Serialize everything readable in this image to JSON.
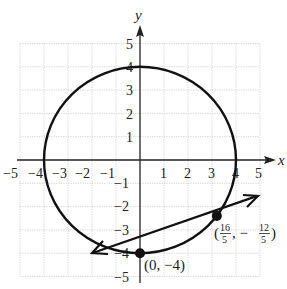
{
  "diagram": {
    "type": "coordinate-plane",
    "axes": {
      "x_label": "x",
      "y_label": "y",
      "x_range": [
        -5,
        5
      ],
      "y_range": [
        -5,
        5
      ],
      "x_ticks": [
        "−5",
        "−4",
        "−3",
        "−2",
        "−1",
        "1",
        "2",
        "3",
        "4",
        "5"
      ],
      "y_ticks": [
        "5",
        "4",
        "3",
        "2",
        "1",
        "−1",
        "−2",
        "−3",
        "−4",
        "−5"
      ],
      "grid": true
    },
    "circle": {
      "equation": "x^2 + y^2 = 16",
      "center": [
        0,
        0
      ],
      "radius": 4
    },
    "line": {
      "equation": "y = x/2 - 4",
      "slope": 0.5,
      "intercept": -4,
      "x_from": -2,
      "x_to": 5,
      "arrows": "both"
    },
    "points": [
      {
        "x": 0,
        "y": -4,
        "label": "(0, −4)"
      },
      {
        "x": 3.2,
        "y": -2.4,
        "label_open": "(",
        "num1": "16",
        "den1": "5",
        "sep": ", −",
        "num2": "12",
        "den2": "5",
        "label_close": ")"
      }
    ]
  }
}
